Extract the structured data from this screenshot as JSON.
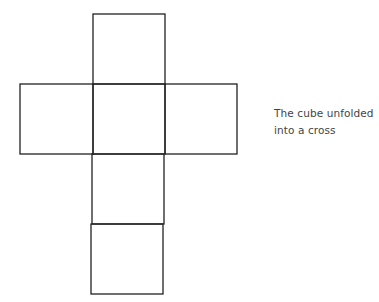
{
  "diagram": {
    "stroke_color": "#222222",
    "faces": [
      {
        "id": "top",
        "x": 93,
        "y": 14,
        "w": 72,
        "h": 70
      },
      {
        "id": "left",
        "x": 20,
        "y": 84,
        "w": 73,
        "h": 70
      },
      {
        "id": "center",
        "x": 93,
        "y": 84,
        "w": 72,
        "h": 70
      },
      {
        "id": "right",
        "x": 165,
        "y": 84,
        "w": 72,
        "h": 70
      },
      {
        "id": "lower",
        "x": 92,
        "y": 154,
        "w": 72,
        "h": 70
      },
      {
        "id": "bottom",
        "x": 91,
        "y": 224,
        "w": 72,
        "h": 70
      }
    ]
  },
  "caption": {
    "line1": "The cube unfolded",
    "line2": "into a cross"
  }
}
